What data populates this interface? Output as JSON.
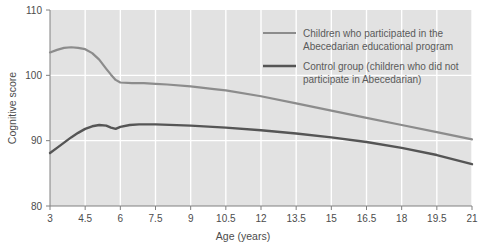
{
  "chart_data": {
    "type": "line",
    "title": "",
    "xlabel": "Age (years)",
    "ylabel": "Cognitive score",
    "xlim": [
      3,
      21
    ],
    "ylim": [
      80,
      110
    ],
    "xticks": [
      "3",
      "4.5",
      "6",
      "7.5",
      "9",
      "10.5",
      "12",
      "13.5",
      "15",
      "16.5",
      "18",
      "19.5",
      "21"
    ],
    "yticks": [
      "80",
      "90",
      "100",
      "110"
    ],
    "grid": true,
    "legend_position": "top-right",
    "plot_background": "#e2e2e2",
    "gridline_color": "#ffffff",
    "series": [
      {
        "name": "Children who participated in the Abecedarian educational program",
        "color": "#8c8c8c",
        "x": [
          3,
          3.3,
          3.6,
          3.9,
          4.2,
          4.5,
          4.8,
          5.1,
          5.4,
          5.6,
          5.8,
          6,
          6.5,
          7,
          7.5,
          8,
          9,
          10,
          10.5,
          12,
          13.5,
          15,
          16.5,
          18,
          19.5,
          21
        ],
        "values": [
          103.5,
          103.9,
          104.2,
          104.3,
          104.2,
          104.0,
          103.4,
          102.4,
          101.0,
          100.1,
          99.3,
          98.9,
          98.8,
          98.8,
          98.7,
          98.6,
          98.3,
          97.9,
          97.7,
          96.8,
          95.7,
          94.6,
          93.5,
          92.4,
          91.3,
          90.2
        ]
      },
      {
        "name": "Control group (children who did not participate in Abecedarian)",
        "color": "#555555",
        "x": [
          3,
          3.3,
          3.6,
          3.9,
          4.2,
          4.5,
          4.8,
          5.1,
          5.4,
          5.6,
          5.8,
          6,
          6.4,
          6.8,
          7.5,
          9,
          10.5,
          12,
          13.5,
          15,
          16.5,
          18,
          19.5,
          21
        ],
        "values": [
          88.1,
          88.9,
          89.7,
          90.5,
          91.2,
          91.8,
          92.2,
          92.4,
          92.3,
          92.0,
          91.8,
          92.1,
          92.4,
          92.5,
          92.5,
          92.3,
          92.0,
          91.6,
          91.1,
          90.5,
          89.8,
          88.9,
          87.8,
          86.4
        ]
      }
    ]
  },
  "legend": {
    "items": [
      {
        "line1": "Children who participated in the",
        "line2": "Abecedarian educational program"
      },
      {
        "line1": "Control group (children who did not",
        "line2": "participate in Abecedarian)"
      }
    ]
  }
}
